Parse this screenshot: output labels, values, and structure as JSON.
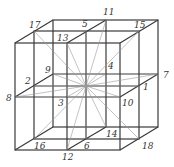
{
  "figure": {
    "center": [
      86,
      86
    ],
    "labels": [
      {
        "id": "1",
        "text": "1",
        "pos": [
          139,
          86
        ],
        "label_pos": [
          143,
          90
        ]
      },
      {
        "id": "2",
        "text": "2",
        "pos": [
          34,
          86
        ],
        "label_pos": [
          25,
          84
        ]
      },
      {
        "id": "3",
        "text": "3",
        "pos": [
          67,
          97
        ],
        "label_pos": [
          58,
          106
        ]
      },
      {
        "id": "4",
        "text": "4",
        "pos": [
          106,
          74
        ],
        "label_pos": [
          108,
          69
        ]
      },
      {
        "id": "5",
        "text": "5",
        "pos": [
          86,
          31
        ],
        "label_pos": [
          82,
          27
        ]
      },
      {
        "id": "6",
        "text": "6",
        "pos": [
          86,
          139
        ],
        "label_pos": [
          84,
          149
        ]
      },
      {
        "id": "7",
        "text": "7",
        "pos": [
          158,
          74
        ],
        "label_pos": [
          163,
          78
        ]
      },
      {
        "id": "8",
        "text": "8",
        "pos": [
          15,
          97
        ],
        "label_pos": [
          6,
          101
        ]
      },
      {
        "id": "9",
        "text": "9",
        "pos": [
          53,
          74
        ],
        "label_pos": [
          45,
          73
        ]
      },
      {
        "id": "10",
        "text": "10",
        "pos": [
          120,
          97
        ],
        "label_pos": [
          122,
          106
        ]
      },
      {
        "id": "11",
        "text": "11",
        "pos": [
          106,
          20
        ],
        "label_pos": [
          103,
          15
        ]
      },
      {
        "id": "12",
        "text": "12",
        "pos": [
          67,
          150
        ],
        "label_pos": [
          62,
          160
        ]
      },
      {
        "id": "13",
        "text": "13",
        "pos": [
          67,
          43
        ],
        "label_pos": [
          57,
          41
        ]
      },
      {
        "id": "14",
        "text": "14",
        "pos": [
          106,
          127
        ],
        "label_pos": [
          106,
          137
        ]
      },
      {
        "id": "15",
        "text": "15",
        "pos": [
          139,
          31
        ],
        "label_pos": [
          134,
          28
        ]
      },
      {
        "id": "16",
        "text": "16",
        "pos": [
          34,
          139
        ],
        "label_pos": [
          34,
          149
        ]
      },
      {
        "id": "17",
        "text": "17",
        "pos": [
          34,
          31
        ],
        "label_pos": [
          29,
          28
        ]
      },
      {
        "id": "18",
        "text": "18",
        "pos": [
          139,
          139
        ],
        "label_pos": [
          142,
          149
        ]
      }
    ]
  }
}
